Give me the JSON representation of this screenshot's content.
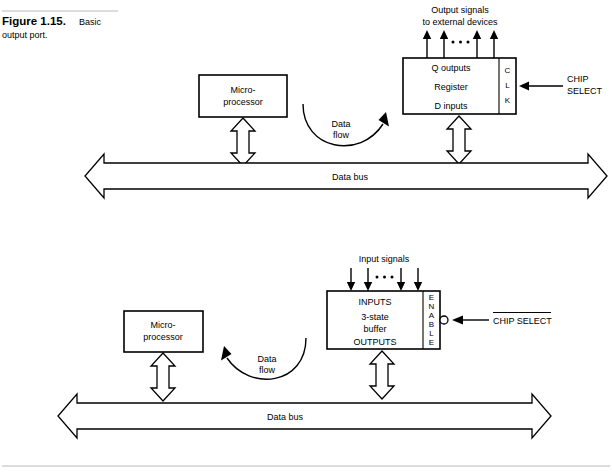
{
  "figure": {
    "label": "Figure 1.15.",
    "caption_line1": "Basic",
    "caption_line2": "output port."
  },
  "diagram_top": {
    "name": "basic-output-port",
    "signals_label_line1": "Output signals",
    "signals_label_line2": "to external devices",
    "signal_arrow_count": 4,
    "ellipsis": "• • •",
    "cpu_label_line1": "Micro-",
    "cpu_label_line2": "processor",
    "dataflow_line1": "Data",
    "dataflow_line2": "flow",
    "dataflow_direction": "right",
    "chip_label_line1": "Q outputs",
    "chip_label_line2": "Register",
    "chip_label_line3": "D inputs",
    "control_pin": [
      "C",
      "L",
      "K"
    ],
    "control_label_line1": "CHIP",
    "control_label_line2": "SELECT",
    "control_active_low": false,
    "bus_label": "Data bus"
  },
  "diagram_bottom": {
    "name": "basic-input-port",
    "signals_label_line1": "Input signals",
    "signals_label_line2": "",
    "signal_arrow_count": 4,
    "ellipsis": "• • •",
    "cpu_label_line1": "Micro-",
    "cpu_label_line2": "processor",
    "dataflow_line1": "Data",
    "dataflow_line2": "flow",
    "dataflow_direction": "left",
    "chip_label_line1": "INPUTS",
    "chip_label_line2": "3-state",
    "chip_label_line2b": "buffer",
    "chip_label_line3": "OUTPUTS",
    "control_pin": [
      "E",
      "N",
      "A",
      "B",
      "L",
      "E"
    ],
    "control_label_line1": "CHIP SELECT",
    "control_active_low": true,
    "bus_label": "Data bus"
  },
  "colors": {
    "ink": "#000000",
    "paper": "#ffffff",
    "rule": "#b9b9b9"
  }
}
